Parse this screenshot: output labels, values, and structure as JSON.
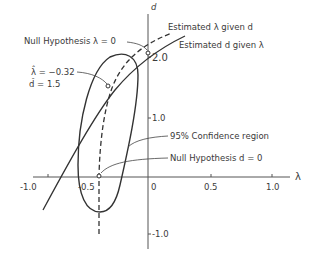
{
  "diagram": {
    "axes": {
      "x_label": "λ",
      "y_label": "d",
      "x_ticks": [
        {
          "label": "-1.0",
          "value": -1.0
        },
        {
          "label": "-0.5",
          "value": -0.5
        },
        {
          "label": "0",
          "value": 0
        },
        {
          "label": "0.5",
          "value": 0.5
        },
        {
          "label": "1.0",
          "value": 1.0
        }
      ],
      "y_ticks": [
        {
          "label": "2.0",
          "value": 2.0
        },
        {
          "label": "1.0",
          "value": 1.0
        },
        {
          "label": "-1.0",
          "value": -1.0
        }
      ]
    },
    "annotations": {
      "null_lambda": "Null Hypothesis  λ = 0",
      "est_lambda": "Estimated  λ  given  d",
      "est_d": "Estimated  d  given  λ",
      "estimate_lambda": "λ̂ = −0.32",
      "estimate_d": "d̂ = 1.5",
      "confidence": "95%  Confidence  region",
      "null_d": "Null  Hypothesis  d = 0"
    },
    "elements": {
      "confidence_region": "95% confidence ellipse",
      "curve_d_given_lambda": "solid curve",
      "curve_lambda_given_d": "dashed curve"
    }
  }
}
